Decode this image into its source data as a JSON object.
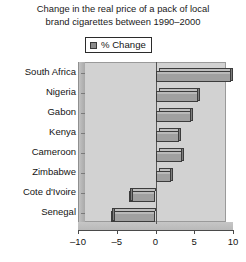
{
  "chart_data": {
    "type": "bar",
    "orientation": "horizontal",
    "title": "Change in the real price of a pack of local brand cigarettes between 1990–2000",
    "title_lines": [
      "Change in the real price of a pack of local",
      "brand cigarettes between 1990–2000"
    ],
    "xlabel": "",
    "ylabel": "",
    "xlim": [
      -10,
      10
    ],
    "xticks": [
      -10,
      -5,
      0,
      5,
      10
    ],
    "xticklabels": [
      "–10",
      "–5",
      "0",
      "5",
      "10"
    ],
    "grid": false,
    "legend": {
      "position": "top-center",
      "entries": [
        {
          "name": "% Change",
          "color": "#8c8c8c"
        }
      ]
    },
    "categories": [
      "South Africa",
      "Nigeria",
      "Gabon",
      "Kenya",
      "Cameroon",
      "Zimbabwe",
      "Cote d'Ivoire",
      "Senegal"
    ],
    "series": [
      {
        "name": "% Change",
        "values": [
          9.8,
          5.5,
          4.6,
          3.0,
          3.4,
          2.0,
          -3.4,
          -5.8
        ]
      }
    ]
  },
  "colors": {
    "bar_fill": "#a0a0a0",
    "bar_outline": "#3c3c3c",
    "plot_background": "#d2d2d2",
    "axis": "#4a4a4a",
    "text": "#141414",
    "page_background": "#ffffff"
  }
}
